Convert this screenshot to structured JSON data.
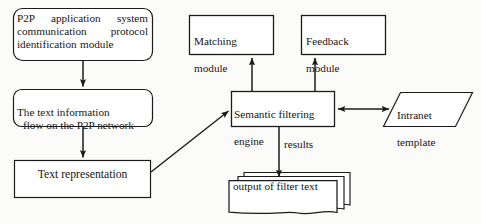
{
  "diagram": {
    "background_color": "#fbfbf9",
    "stroke_color": "#1b1b1b",
    "fill_color": "#ffffff",
    "nodes": {
      "p2p_module": {
        "label": "P2P application system communication protocol identification module",
        "shape": "rounded-rectangle"
      },
      "text_flow": {
        "label_line1": "The text information",
        "label_line2": "flow on the P2P network",
        "shape": "rounded-rectangle"
      },
      "text_representation": {
        "label": "Text representation",
        "shape": "rectangle"
      },
      "matching_module": {
        "label_line1": "Matching",
        "label_line2": "module",
        "shape": "rectangle"
      },
      "feedback_module": {
        "label_line1": "Feedback",
        "label_line2": "module",
        "shape": "rectangle"
      },
      "semantic_engine": {
        "label_line1": "Semantic filtering",
        "label_line2": "engine",
        "shape": "rectangle"
      },
      "intranet_template": {
        "label_line1": "Intranet",
        "label_line2": "template",
        "shape": "parallelogram"
      },
      "output_filter_text": {
        "label": "output of filter text",
        "shape": "multi-document-stack"
      }
    },
    "edges": {
      "results_label": "results",
      "p2p_to_flow": "arrow-down",
      "flow_to_representation": "arrow-down",
      "representation_to_engine": "arrow-diagonal",
      "engine_to_matching": "arrow-up",
      "engine_to_feedback": "arrow-up",
      "engine_to_intranet": "arrow-bidirectional",
      "engine_to_output": "arrow-down"
    }
  }
}
